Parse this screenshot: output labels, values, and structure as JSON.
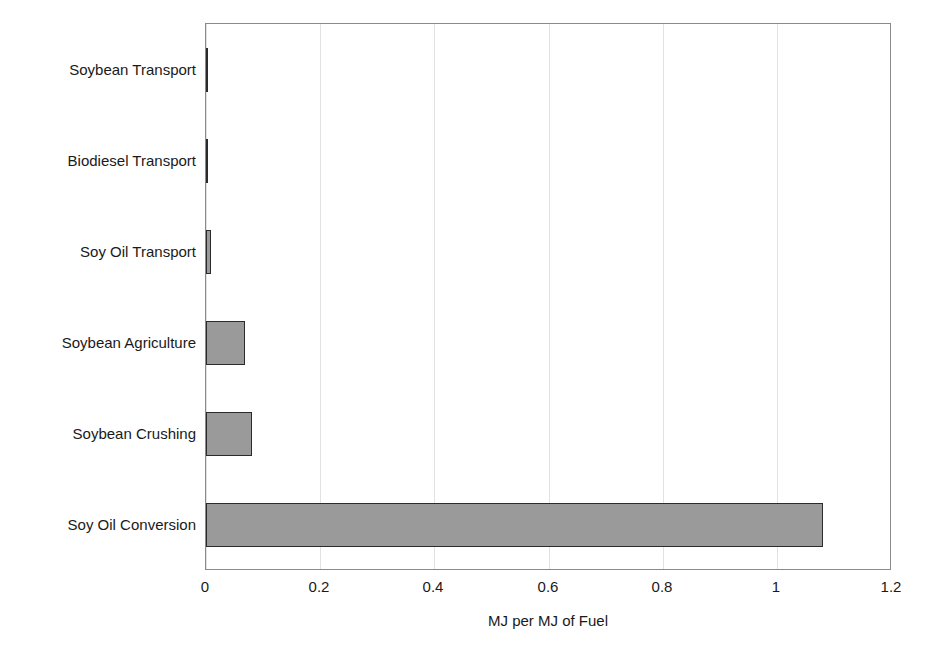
{
  "chart_data": {
    "type": "bar",
    "orientation": "horizontal",
    "title": "",
    "subtitle": "",
    "xlabel": "MJ per MJ of Fuel",
    "ylabel": "",
    "categories": [
      "Soybean Transport",
      "Biodiesel Transport",
      "Soy Oil Transport",
      "Soybean Agriculture",
      "Soybean Crushing",
      "Soy Oil Conversion"
    ],
    "values": [
      0.003,
      0.004,
      0.008,
      0.068,
      0.08,
      1.083
    ],
    "xlim": [
      0,
      1.2
    ],
    "xticks": [
      0,
      0.2,
      0.4,
      0.6,
      0.8,
      1,
      1.2
    ],
    "xtick_labels": [
      "0",
      "0.2",
      "0.4",
      "0.6",
      "0.8",
      "1",
      "1.2"
    ],
    "grid": "vertical",
    "legend": "none",
    "bar_fill_color": "#9a9a9a",
    "bar_border_color": "#2b2b2b",
    "axis_color": "#8a8a8a",
    "gridline_color": "#e2e2e2",
    "text_color": "#1a1a1a"
  }
}
